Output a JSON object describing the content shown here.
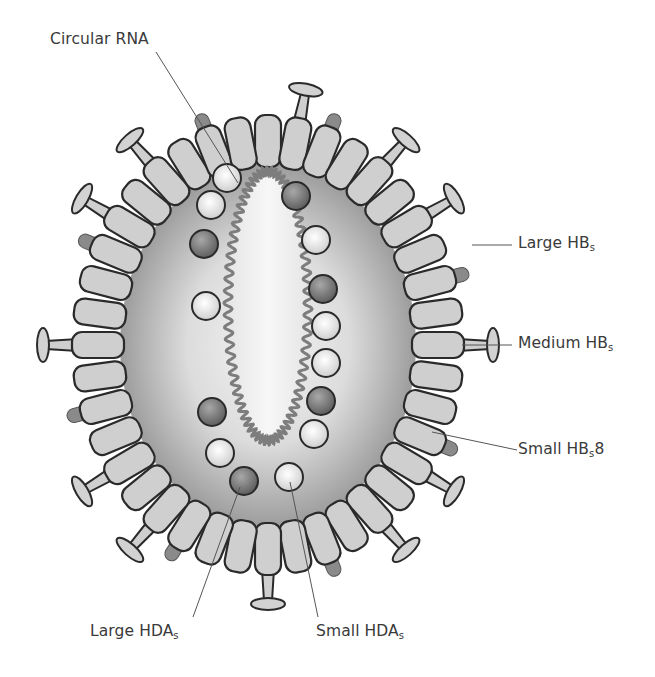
{
  "diagram": {
    "colors": {
      "outline": "#2a2a2a",
      "unit_fill": "#cfcfcf",
      "spike_dark": "#8a8a8a",
      "envelope_inner": "#f2f2f2",
      "envelope_outer": "#9a9a9a",
      "particle_light": "#e6e6e6",
      "particle_dark": "#7a7a7a",
      "rna": "#7d7d7d",
      "label_text": "#3a3a3a"
    },
    "labels": [
      {
        "id": "circular-rna",
        "text": "Circular RNA",
        "sub": "",
        "suffix": ""
      },
      {
        "id": "large-hbs",
        "text": "Large HB",
        "sub": "s",
        "suffix": ""
      },
      {
        "id": "medium-hbs",
        "text": "Medium HB",
        "sub": "s",
        "suffix": ""
      },
      {
        "id": "small-hbs",
        "text": "Small HB",
        "sub": "s",
        "suffix": "8"
      },
      {
        "id": "large-hdas",
        "text": "Large HDA",
        "sub": "s",
        "suffix": ""
      },
      {
        "id": "small-hdas",
        "text": "Small HDA",
        "sub": "s",
        "suffix": ""
      }
    ]
  }
}
